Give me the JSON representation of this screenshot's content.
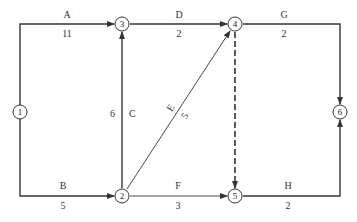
{
  "nodes": [
    {
      "id": "1",
      "x": 20,
      "y": 112
    },
    {
      "id": "2",
      "x": 122,
      "y": 196
    },
    {
      "id": "3",
      "x": 122,
      "y": 24
    },
    {
      "id": "4",
      "x": 235,
      "y": 24
    },
    {
      "id": "5",
      "x": 235,
      "y": 196
    },
    {
      "id": "6",
      "x": 340,
      "y": 112
    }
  ],
  "activities": [
    {
      "name": "A",
      "duration": "11",
      "from": "1",
      "to": "3",
      "dummy": false
    },
    {
      "name": "B",
      "duration": "5",
      "from": "1",
      "to": "2",
      "dummy": false
    },
    {
      "name": "C",
      "duration": "6",
      "from": "2",
      "to": "3",
      "dummy": false
    },
    {
      "name": "D",
      "duration": "2",
      "from": "3",
      "to": "4",
      "dummy": false
    },
    {
      "name": "E",
      "duration": "5",
      "from": "2",
      "to": "4",
      "dummy": false
    },
    {
      "name": "F",
      "duration": "3",
      "from": "2",
      "to": "5",
      "dummy": false
    },
    {
      "name": "G",
      "duration": "2",
      "from": "4",
      "to": "6",
      "dummy": false
    },
    {
      "name": "H",
      "duration": "2",
      "from": "5",
      "to": "6",
      "dummy": false
    },
    {
      "name": "",
      "duration": "",
      "from": "4",
      "to": "5",
      "dummy": true
    }
  ],
  "colors": {
    "line": "#333333",
    "background": "#ffffff"
  }
}
